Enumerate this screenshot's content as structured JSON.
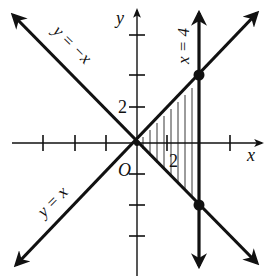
{
  "figure": {
    "type": "coordinate-plane",
    "axes": {
      "x_label": "x",
      "y_label": "y",
      "origin_label": "O",
      "x_tick_label": "2",
      "y_tick_label": "2",
      "tick_step": 2
    },
    "lines": [
      {
        "name": "y-equals-x",
        "label": "y = x"
      },
      {
        "name": "y-equals-neg-x",
        "label": "y = −x"
      },
      {
        "name": "x-equals-4",
        "label": "x = 4"
      }
    ],
    "points": [
      {
        "name": "intersection-upper",
        "x": 4,
        "y": 4
      },
      {
        "name": "intersection-lower",
        "x": 4,
        "y": -4
      }
    ],
    "shaded_region": "triangle bounded by y = x, y = −x, and x = 4 (vertical hatching)"
  },
  "colors": {
    "ink": "#111111",
    "background": "#ffffff"
  }
}
